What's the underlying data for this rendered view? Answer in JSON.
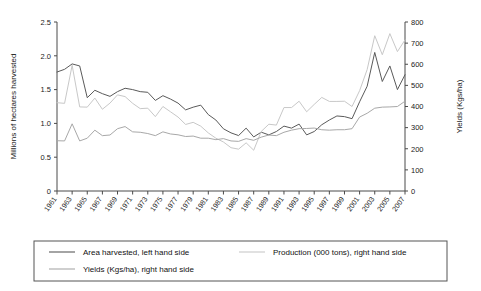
{
  "chart_data": {
    "type": "line",
    "title": "",
    "subtitle": "",
    "xlabel": "",
    "ylabel": "Millions of hectares harvested",
    "y2label": "Yields (Kgs/ha)",
    "grid": false,
    "legend_position": "bottom",
    "ylim": [
      0,
      2.5
    ],
    "y2lim": [
      0,
      800
    ],
    "yticks": [
      "0",
      "0.5",
      "1.0",
      "1.5",
      "2.0",
      "2.5"
    ],
    "ytick_values": [
      0,
      0.5,
      1.0,
      1.5,
      2.0,
      2.5
    ],
    "y2ticks": [
      "0",
      "100",
      "200",
      "300",
      "400",
      "500",
      "600",
      "700",
      "800"
    ],
    "y2tick_values": [
      0,
      100,
      200,
      300,
      400,
      500,
      600,
      700,
      800
    ],
    "x": [
      1961,
      1962,
      1963,
      1964,
      1965,
      1966,
      1967,
      1968,
      1969,
      1970,
      1971,
      1972,
      1973,
      1974,
      1975,
      1976,
      1977,
      1978,
      1979,
      1980,
      1981,
      1982,
      1983,
      1984,
      1985,
      1986,
      1987,
      1988,
      1989,
      1990,
      1991,
      1992,
      1993,
      1994,
      1995,
      1996,
      1997,
      1998,
      1999,
      2000,
      2001,
      2002,
      2003,
      2004,
      2005,
      2006,
      2007
    ],
    "xtick_labels": [
      "1961",
      "1963",
      "1965",
      "1967",
      "1969",
      "1971",
      "1973",
      "1975",
      "1977",
      "1979",
      "1981",
      "1983",
      "1985",
      "1987",
      "1989",
      "1991",
      "1993",
      "1995",
      "1997",
      "1999",
      "2001",
      "2003",
      "2005",
      "2007"
    ],
    "series": [
      {
        "name": "Area harvested, left hand side",
        "axis": "left",
        "color": "#5a5a5a",
        "values": [
          1.76,
          1.8,
          1.88,
          1.85,
          1.38,
          1.49,
          1.44,
          1.4,
          1.47,
          1.52,
          1.5,
          1.47,
          1.46,
          1.34,
          1.41,
          1.36,
          1.3,
          1.2,
          1.24,
          1.27,
          1.13,
          1.05,
          0.92,
          0.86,
          0.82,
          0.93,
          0.8,
          0.87,
          0.83,
          0.88,
          0.96,
          0.93,
          0.99,
          0.83,
          0.88,
          0.98,
          1.05,
          1.11,
          1.1,
          1.07,
          1.32,
          1.55,
          2.05,
          1.62,
          1.85,
          1.5,
          1.72
        ]
      },
      {
        "name": "Production (000 tons), right hand side",
        "axis": "right",
        "color": "#c8c8c8",
        "values": [
          418,
          415,
          595,
          398,
          397,
          440,
          387,
          416,
          455,
          447,
          415,
          390,
          392,
          352,
          400,
          375,
          350,
          315,
          325,
          307,
          275,
          250,
          232,
          205,
          198,
          228,
          193,
          282,
          316,
          312,
          395,
          395,
          425,
          375,
          410,
          443,
          424,
          424,
          425,
          400,
          475,
          575,
          735,
          645,
          745,
          660,
          715
        ]
      },
      {
        "name": "Yields (Kgs/ha), right hand side",
        "axis": "right",
        "color": "#a8a8a8",
        "values": [
          238,
          237,
          318,
          237,
          250,
          288,
          262,
          265,
          295,
          305,
          280,
          278,
          272,
          262,
          280,
          270,
          266,
          258,
          260,
          250,
          250,
          243,
          248,
          237,
          235,
          248,
          240,
          255,
          265,
          262,
          278,
          288,
          295,
          296,
          298,
          290,
          288,
          290,
          290,
          295,
          350,
          368,
          392,
          397,
          398,
          400,
          425
        ]
      }
    ]
  },
  "legend": {
    "entries": [
      {
        "label": "Area harvested, left hand side",
        "color": "#5a5a5a"
      },
      {
        "label": "Production (000 tons), right hand side",
        "color": "#c8c8c8"
      },
      {
        "label": "Yields (Kgs/ha), right hand side",
        "color": "#a8a8a8"
      }
    ]
  },
  "axes": {
    "left_title": "Millions of hectares harvested",
    "right_title": "Yields (Kgs/ha)"
  }
}
